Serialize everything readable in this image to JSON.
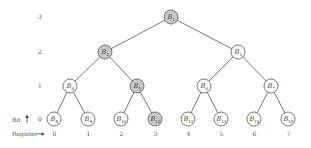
{
  "diagram": {
    "type": "binary-tree",
    "level_axis_label": "Bit",
    "register_axis_label": "Register",
    "colors": {
      "highlight_fill": "#c8c8c8",
      "normal_fill": "#ffffff",
      "stroke": "#555555"
    },
    "levels": [
      {
        "label": "3",
        "y": 17
      },
      {
        "label": "2",
        "y": 52
      },
      {
        "label": "1",
        "y": 86
      },
      {
        "label": "0",
        "y": 119
      }
    ],
    "nodes": [
      {
        "id": "B1",
        "base": "B",
        "sub": "1",
        "x": 171,
        "y": 17,
        "highlighted": true
      },
      {
        "id": "B2",
        "base": "B",
        "sub": "2",
        "x": 105,
        "y": 52,
        "highlighted": true
      },
      {
        "id": "B3",
        "base": "B",
        "sub": "3",
        "x": 238,
        "y": 52,
        "highlighted": false
      },
      {
        "id": "B4",
        "base": "B",
        "sub": "4",
        "x": 70,
        "y": 86,
        "highlighted": false
      },
      {
        "id": "B5",
        "base": "B",
        "sub": "5",
        "x": 137,
        "y": 86,
        "highlighted": true
      },
      {
        "id": "B6",
        "base": "B",
        "sub": "6",
        "x": 204,
        "y": 86,
        "highlighted": false
      },
      {
        "id": "B7",
        "base": "B",
        "sub": "7",
        "x": 271,
        "y": 86,
        "highlighted": false
      },
      {
        "id": "B8",
        "base": "B",
        "sub": "8",
        "x": 54,
        "y": 119,
        "highlighted": false
      },
      {
        "id": "B9",
        "base": "B",
        "sub": "9",
        "x": 88,
        "y": 119,
        "highlighted": false
      },
      {
        "id": "B10",
        "base": "B",
        "sub": "10",
        "x": 121,
        "y": 119,
        "highlighted": false
      },
      {
        "id": "B11",
        "base": "B",
        "sub": "11",
        "x": 155,
        "y": 119,
        "highlighted": true
      },
      {
        "id": "B12",
        "base": "B",
        "sub": "12",
        "x": 188,
        "y": 119,
        "highlighted": false
      },
      {
        "id": "B13",
        "base": "B",
        "sub": "13",
        "x": 221,
        "y": 119,
        "highlighted": false
      },
      {
        "id": "B14",
        "base": "B",
        "sub": "14",
        "x": 254,
        "y": 119,
        "highlighted": false
      },
      {
        "id": "B15",
        "base": "B",
        "sub": "15",
        "x": 288,
        "y": 119,
        "highlighted": false
      }
    ],
    "edges": [
      [
        "B1",
        "B2"
      ],
      [
        "B1",
        "B3"
      ],
      [
        "B2",
        "B4"
      ],
      [
        "B2",
        "B5"
      ],
      [
        "B3",
        "B6"
      ],
      [
        "B3",
        "B7"
      ],
      [
        "B4",
        "B8"
      ],
      [
        "B4",
        "B9"
      ],
      [
        "B5",
        "B10"
      ],
      [
        "B5",
        "B11"
      ],
      [
        "B6",
        "B12"
      ],
      [
        "B6",
        "B13"
      ],
      [
        "B7",
        "B14"
      ],
      [
        "B7",
        "B15"
      ]
    ],
    "registers": [
      "0",
      "1",
      "2",
      "3",
      "4",
      "5",
      "6",
      "7"
    ]
  }
}
